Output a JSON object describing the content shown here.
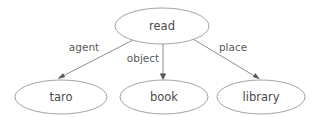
{
  "diagram": {
    "type": "semantic-role-graph",
    "background_color": "#ffffff",
    "node_stroke_color": "#999999",
    "node_fill_color": "#ffffff",
    "node_text_color": "#4a4a4a",
    "edge_color": "#808080",
    "edge_label_color": "#5a5a5a",
    "arrowhead_color": "#555555",
    "nodes": [
      {
        "id": "read",
        "label": "read",
        "cx": 162,
        "cy": 26,
        "rx": 47,
        "ry": 18
      },
      {
        "id": "taro",
        "label": "taro",
        "cx": 61,
        "cy": 97,
        "rx": 46,
        "ry": 17
      },
      {
        "id": "book",
        "label": "book",
        "cx": 164,
        "cy": 97,
        "rx": 44,
        "ry": 17
      },
      {
        "id": "library",
        "label": "library",
        "cx": 261,
        "cy": 97,
        "rx": 44,
        "ry": 17
      }
    ],
    "edges": [
      {
        "id": "agent",
        "label": "agent",
        "from": "read",
        "to": "taro",
        "x1": 133,
        "y1": 40,
        "x2": 59,
        "y2": 78,
        "label_x": 84,
        "label_y": 48
      },
      {
        "id": "object",
        "label": "object",
        "from": "read",
        "to": "book",
        "x1": 163,
        "y1": 44,
        "x2": 163,
        "y2": 78,
        "label_x": 143,
        "label_y": 59
      },
      {
        "id": "place",
        "label": "place",
        "from": "read",
        "to": "library",
        "x1": 193,
        "y1": 39,
        "x2": 258,
        "y2": 78,
        "label_x": 233,
        "label_y": 48
      }
    ]
  }
}
